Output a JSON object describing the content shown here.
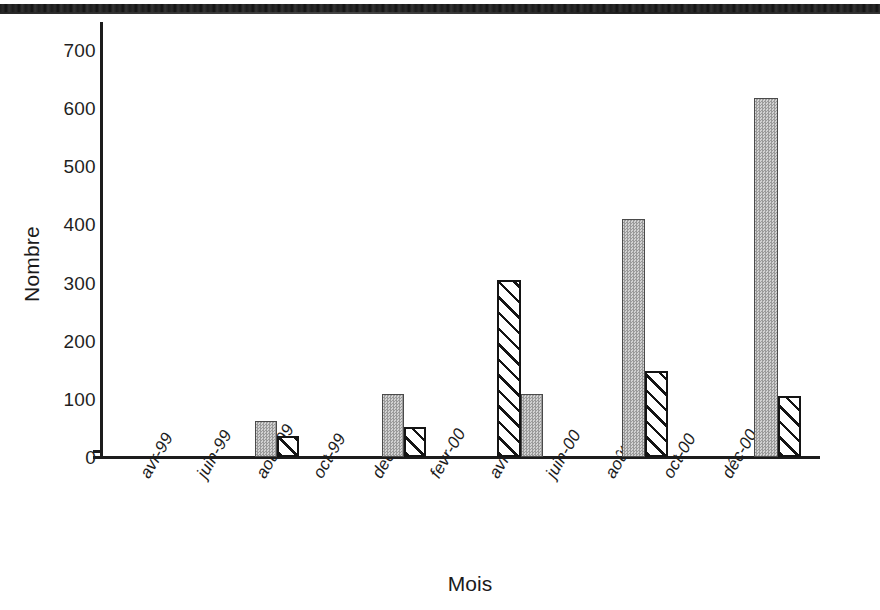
{
  "figure": {
    "scan_artifact": "dark-scan-band-top",
    "background": "#ffffff",
    "ink_color": "#1c1c1c"
  },
  "axes": {
    "y_title": "Nombre",
    "x_title": "Mois",
    "y_ticks": [
      "0",
      "100",
      "200",
      "300",
      "400",
      "500",
      "600",
      "700"
    ],
    "x_ticks": [
      "avr-99",
      "juin-99",
      "août-99",
      "oct-99",
      "dec-99",
      "fevr-00",
      "avr-00",
      "juin-00",
      "août-00",
      "oct-00",
      "déc-00"
    ]
  },
  "series_styles": {
    "solid_fill": "#b4b4b4",
    "solid_border": "#4a4a4a",
    "hatch_fill": "#ffffff",
    "hatch_border": "#141414"
  },
  "chart_data": {
    "type": "bar",
    "title": "",
    "subtitle": "",
    "xlabel": "Mois",
    "ylabel": "Nombre",
    "ylim": [
      0,
      700
    ],
    "y_tick_step": 100,
    "grid": false,
    "legend": null,
    "legend_position": "none",
    "categories": [
      "avr-99",
      "juin-99",
      "août-99",
      "oct-99",
      "dec-99",
      "fevr-00",
      "avr-00",
      "juin-00",
      "août-00",
      "oct-00",
      "déc-00"
    ],
    "series": [
      {
        "name": "gray-solid",
        "style": "solid",
        "values": [
          0,
          0,
          62,
          0,
          108,
          0,
          108,
          0,
          410,
          0,
          618
        ]
      },
      {
        "name": "white-hatched",
        "style": "hatch",
        "values": [
          0,
          0,
          37,
          0,
          52,
          0,
          305,
          0,
          148,
          0,
          105
        ]
      }
    ],
    "bars": [
      {
        "category": "août-99",
        "style": "solid",
        "value": 62,
        "x": 255,
        "width": 22
      },
      {
        "category": "août-99",
        "style": "hatch",
        "value": 37,
        "x": 277,
        "width": 22
      },
      {
        "category": "dec-99",
        "style": "solid",
        "value": 108,
        "x": 382,
        "width": 22
      },
      {
        "category": "dec-99",
        "style": "hatch",
        "value": 52,
        "x": 404,
        "width": 22
      },
      {
        "category": "avr-00",
        "style": "hatch",
        "value": 305,
        "x": 497,
        "width": 24
      },
      {
        "category": "avr-00",
        "style": "solid",
        "value": 108,
        "x": 521,
        "width": 22
      },
      {
        "category": "août-00",
        "style": "solid",
        "value": 410,
        "x": 622,
        "width": 23
      },
      {
        "category": "août-00",
        "style": "hatch",
        "value": 148,
        "x": 645,
        "width": 23
      },
      {
        "category": "déc-00",
        "style": "solid",
        "value": 618,
        "x": 754,
        "width": 24
      },
      {
        "category": "déc-00",
        "style": "hatch",
        "value": 105,
        "x": 778,
        "width": 23
      }
    ],
    "tick_x_positions": [
      140,
      197,
      256,
      313,
      372,
      430,
      489,
      546,
      605,
      663,
      722
    ]
  }
}
